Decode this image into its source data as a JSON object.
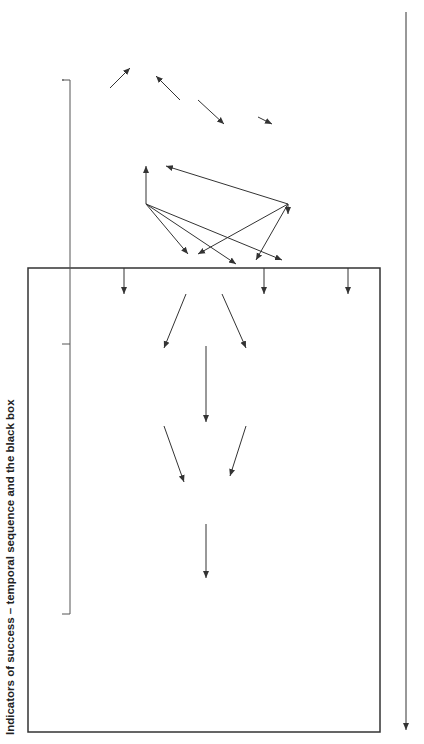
{
  "title": "Indicators of success – temporal sequence and the black box",
  "box": {
    "header": "Indicator",
    "columns": {
      "intermediate": "Intermediate",
      "outcome": "Outcome"
    }
  },
  "nodes": {
    "indirect_pretesting": "Indirect\npre-testing",
    "adoption_of_video": "Adoption of video",
    "training": "Training",
    "development_teaching": "Development of\nteaching skills",
    "implementation": "Implementation of\neffective personal,\nsocial and health skills\nprogramme in school",
    "change_knowledge": "Change in pupils'\nknowledge and beliefs,\nincluding recognition of\nat-risk status",
    "positive_attitude": "Positive attitude to\ncontraception",
    "enhanced_self_efficacy": "Enhanced self-\nefficacy beliefs,\nself-esteem and\nacquisition of\nskills",
    "awareness_family": "Awareness of family\nplanning services",
    "behavioural_intentions": "Behavioural\nintentions",
    "communication_partner": "Communication\nwith partner",
    "obtaining_contraceptives": "Obtaining contraceptives\nfrom family planning clinic\nor alternative sources",
    "appropriate_usage": "Appropriate\nusage of\ncontraceptives",
    "reduced_incidence": "Reduced incidence of\nunwanted pregnancy"
  },
  "axis": {
    "label": "Time",
    "start": "Proximal",
    "end": "Distal"
  },
  "colors": {
    "line": "#333333",
    "text": "#222222",
    "background": "#ffffff"
  }
}
